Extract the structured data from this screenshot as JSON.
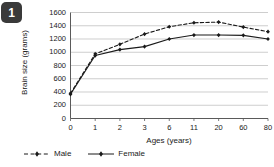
{
  "badge": {
    "label": "1"
  },
  "chart_data": {
    "type": "line",
    "title": "",
    "xlabel": "Ages (years)",
    "ylabel": "Brain size (grams)",
    "categories": [
      "0",
      "1",
      "2",
      "3",
      "6",
      "11",
      "20",
      "60",
      "80"
    ],
    "ylim": [
      0,
      1600
    ],
    "yticks": [
      "0",
      "200",
      "400",
      "600",
      "800",
      "1000",
      "1200",
      "1400",
      "1600"
    ],
    "grid": "horizontal",
    "legend_position": "bottom-left",
    "series": [
      {
        "name": "Male",
        "style": "dashed",
        "color": "#1a1a1a",
        "values": [
          380,
          975,
          1120,
          1275,
          1385,
          1445,
          1455,
          1380,
          1310
        ]
      },
      {
        "name": "Female",
        "style": "solid",
        "color": "#1a1a1a",
        "values": [
          365,
          950,
          1040,
          1085,
          1200,
          1260,
          1260,
          1255,
          1200
        ]
      }
    ]
  }
}
